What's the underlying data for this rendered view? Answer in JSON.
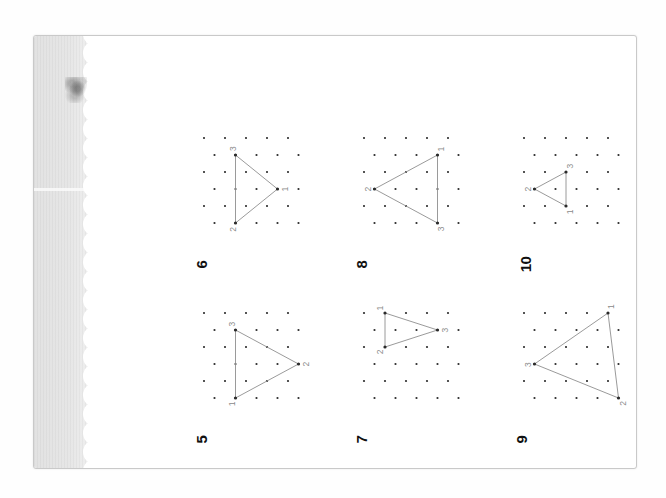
{
  "document": {
    "kind": "scanned-workbook-page",
    "orientation": "rotated-90-clockwise",
    "page_number": "9",
    "header_label": "[1] 图形 口口口",
    "sheet_background": "#ffffff",
    "gutter_shadow_color": "#e2e2e2",
    "ink_color": "#2b2b2b",
    "line_color": "#8e8e8e",
    "label_color": "#8a8a8a"
  },
  "grid": {
    "type": "isometric-dot-lattice",
    "columns": 5,
    "rows": 6,
    "dot_radius": 1.1,
    "col_spacing": 21,
    "row_spacing": 17,
    "stagger_offset": 10.5
  },
  "problems": [
    {
      "number": "5",
      "column": 1,
      "row": 2,
      "triangle": {
        "vertices": [
          {
            "label": "1",
            "col": 1,
            "row": 5
          },
          {
            "label": "2",
            "col": 4,
            "row": 3
          },
          {
            "label": "3",
            "col": 1,
            "row": 1
          }
        ]
      }
    },
    {
      "number": "6",
      "column": 1,
      "row": 1,
      "triangle": {
        "vertices": [
          {
            "label": "1",
            "col": 3,
            "row": 3
          },
          {
            "label": "2",
            "col": 1,
            "row": 5
          },
          {
            "label": "3",
            "col": 1,
            "row": 1
          }
        ]
      }
    },
    {
      "number": "7",
      "column": 2,
      "row": 2,
      "triangle": {
        "vertices": [
          {
            "label": "1",
            "col": 1,
            "row": 0
          },
          {
            "label": "2",
            "col": 1,
            "row": 2
          },
          {
            "label": "3",
            "col": 3,
            "row": 1
          }
        ]
      }
    },
    {
      "number": "8",
      "column": 2,
      "row": 1,
      "triangle": {
        "vertices": [
          {
            "label": "1",
            "col": 3,
            "row": 1
          },
          {
            "label": "2",
            "col": 0,
            "row": 3
          },
          {
            "label": "3",
            "col": 3,
            "row": 5
          }
        ]
      }
    },
    {
      "number": "9",
      "column": 3,
      "row": 2,
      "triangle": {
        "vertices": [
          {
            "label": "1",
            "col": 4,
            "row": 0
          },
          {
            "label": "2",
            "col": 4,
            "row": 5
          },
          {
            "label": "3",
            "col": 0,
            "row": 3
          }
        ]
      }
    },
    {
      "number": "10",
      "column": 3,
      "row": 1,
      "triangle": {
        "vertices": [
          {
            "label": "1",
            "col": 2,
            "row": 4
          },
          {
            "label": "2",
            "col": 0,
            "row": 3
          },
          {
            "label": "3",
            "col": 2,
            "row": 2
          }
        ]
      }
    }
  ]
}
